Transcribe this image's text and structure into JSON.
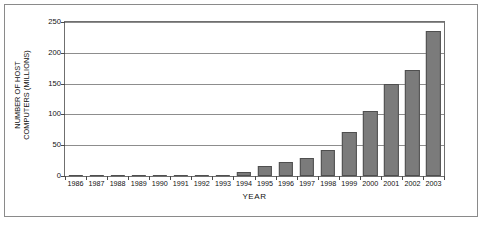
{
  "chart_data": {
    "type": "bar",
    "title": "",
    "xlabel": "YEAR",
    "ylabel": "NUMBER OF HOST COMPUTERS (MILLIONS)",
    "ylabel_lines": [
      "NUMBER OF HOST",
      "COMPUTERS (MILLIONS)"
    ],
    "categories": [
      "1986",
      "1987",
      "1988",
      "1989",
      "1990",
      "1991",
      "1992",
      "1993",
      "1994",
      "1995",
      "1996",
      "1997",
      "1998",
      "1999",
      "2000",
      "2001",
      "2002",
      "2003"
    ],
    "values": [
      0.006,
      0.03,
      0.06,
      0.16,
      0.4,
      0.7,
      1.1,
      2.2,
      5.8,
      16,
      22,
      30,
      43,
      72,
      105,
      150,
      172,
      236
    ],
    "ylim": [
      0,
      250
    ],
    "yticks": [
      0,
      50,
      100,
      150,
      200,
      250
    ],
    "ytick_labels": [
      "0",
      "50",
      "100",
      "150",
      "200",
      "250"
    ],
    "grid": true,
    "legend": false,
    "bar_color": "#7b7b7b",
    "bar_edge_color": "#4f4f4f",
    "gridline_color": "#8d8d8d",
    "frame_color": "#6f6f6f",
    "background": "#ffffff"
  }
}
